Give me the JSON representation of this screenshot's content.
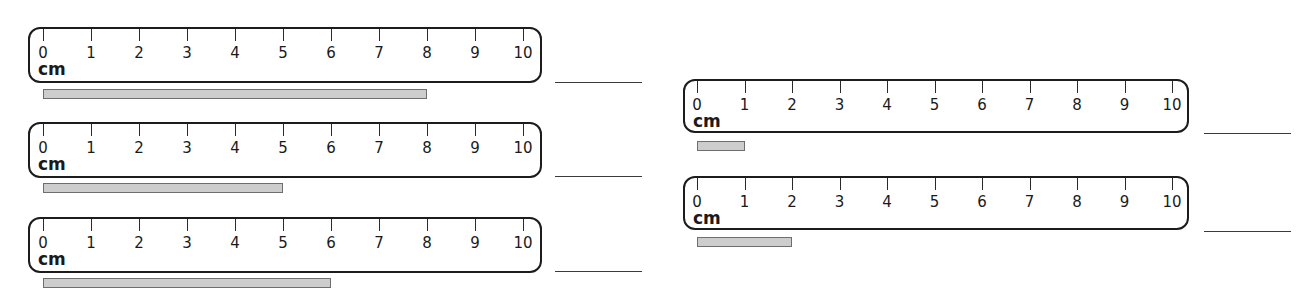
{
  "worksheet": {
    "unit": "cm",
    "tick_labels": [
      "0",
      "1",
      "2",
      "3",
      "4",
      "5",
      "6",
      "7",
      "8",
      "9",
      "10"
    ],
    "items": [
      {
        "id": "a",
        "column": "left",
        "bar_length_cm": 8,
        "answer": ""
      },
      {
        "id": "b",
        "column": "left",
        "bar_length_cm": 5,
        "answer": ""
      },
      {
        "id": "c",
        "column": "left",
        "bar_length_cm": 6,
        "answer": ""
      },
      {
        "id": "d",
        "column": "right",
        "bar_length_cm": 1,
        "answer": ""
      },
      {
        "id": "e",
        "column": "right",
        "bar_length_cm": 2,
        "answer": ""
      }
    ]
  },
  "layout": {
    "left": {
      "ruler_x": 28,
      "ruler_w": 514,
      "tick0": 15,
      "px_per_cm": 48,
      "bar_x": 43,
      "line_x": 555,
      "ruler_h": 56
    },
    "right": {
      "ruler_x": 683,
      "ruler_w": 506,
      "tick0": 14,
      "px_per_cm": 47.5,
      "bar_x": 697,
      "line_x": 1204,
      "ruler_h": 54
    },
    "rows": [
      {
        "ruler_y": 27,
        "bar_y": 89,
        "line_y": 82
      },
      {
        "ruler_y": 122,
        "bar_y": 183,
        "line_y": 176
      },
      {
        "ruler_y": 217,
        "bar_y": 278,
        "line_y": 271
      },
      {
        "ruler_y": 79,
        "bar_y": 141,
        "line_y": 133
      },
      {
        "ruler_y": 176,
        "bar_y": 237,
        "line_y": 231
      }
    ]
  },
  "colors": {
    "ruler_border": "#1c1c1c",
    "bar_fill": "#cdcdcd",
    "bar_border": "#6e6e6e",
    "answer_line": "#3a3a3a"
  }
}
